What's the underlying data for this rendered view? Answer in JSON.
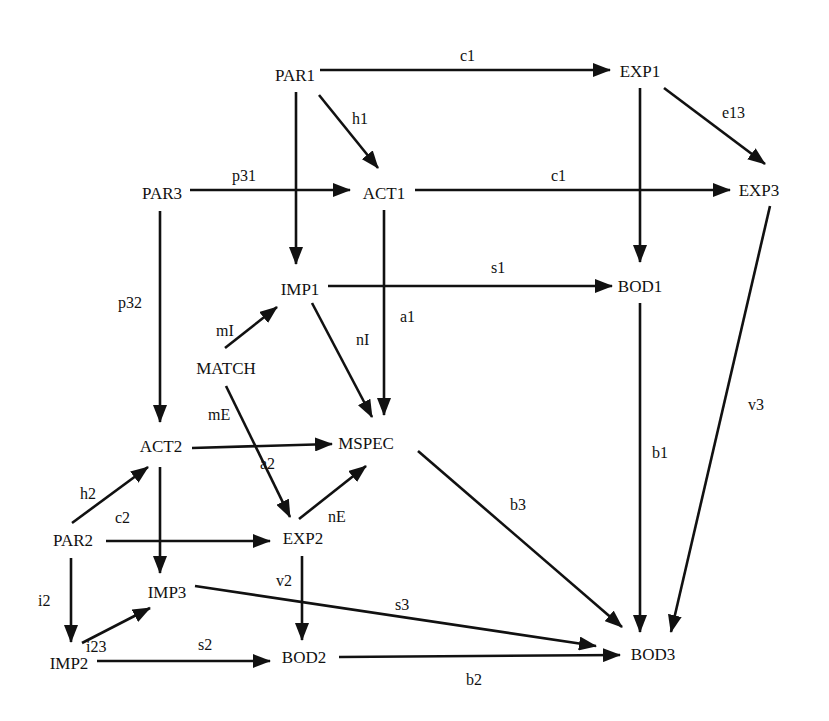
{
  "diagram": {
    "type": "directed-path-diagram",
    "nodes": [
      {
        "id": "PAR1",
        "label": "PAR1",
        "x": 295,
        "y": 75
      },
      {
        "id": "EXP1",
        "label": "EXP1",
        "x": 640,
        "y": 71
      },
      {
        "id": "PAR3",
        "label": "PAR3",
        "x": 162,
        "y": 193
      },
      {
        "id": "ACT1",
        "label": "ACT1",
        "x": 384,
        "y": 193
      },
      {
        "id": "EXP3",
        "label": "EXP3",
        "x": 759,
        "y": 190
      },
      {
        "id": "IMP1",
        "label": "IMP1",
        "x": 300,
        "y": 289
      },
      {
        "id": "BOD1",
        "label": "BOD1",
        "x": 640,
        "y": 286
      },
      {
        "id": "MATCH",
        "label": "MATCH",
        "x": 226,
        "y": 368
      },
      {
        "id": "ACT2",
        "label": "ACT2",
        "x": 161,
        "y": 446
      },
      {
        "id": "MSPEC",
        "label": "MSPEC",
        "x": 366,
        "y": 443
      },
      {
        "id": "PAR2",
        "label": "PAR2",
        "x": 73,
        "y": 540
      },
      {
        "id": "EXP2",
        "label": "EXP2",
        "x": 303,
        "y": 538
      },
      {
        "id": "IMP3",
        "label": "IMP3",
        "x": 167,
        "y": 592
      },
      {
        "id": "IMP2",
        "label": "IMP2",
        "x": 69,
        "y": 663
      },
      {
        "id": "BOD2",
        "label": "BOD2",
        "x": 304,
        "y": 657
      },
      {
        "id": "BOD3",
        "label": "BOD3",
        "x": 653,
        "y": 654
      }
    ],
    "edges": [
      {
        "from": "PAR1",
        "to": "EXP1",
        "label": "c1",
        "x1": 320,
        "y1": 70,
        "x2": 610,
        "y2": 70,
        "lx": 460,
        "ly": 61
      },
      {
        "from": "PAR1",
        "to": "ACT1",
        "label": "h1",
        "x1": 319,
        "y1": 95,
        "x2": 378,
        "y2": 168,
        "lx": 352,
        "ly": 124
      },
      {
        "from": "PAR1",
        "to": "IMP1",
        "label": "",
        "x1": 296,
        "y1": 92,
        "x2": 296,
        "y2": 264,
        "lx": 0,
        "ly": 0
      },
      {
        "from": "EXP1",
        "to": "EXP3",
        "label": "e13",
        "x1": 664,
        "y1": 88,
        "x2": 765,
        "y2": 164,
        "lx": 722,
        "ly": 118
      },
      {
        "from": "EXP1",
        "to": "BOD1",
        "label": "",
        "x1": 640,
        "y1": 88,
        "x2": 640,
        "y2": 262,
        "lx": 0,
        "ly": 0
      },
      {
        "from": "PAR3",
        "to": "ACT1",
        "label": "p31",
        "x1": 190,
        "y1": 190,
        "x2": 350,
        "y2": 190,
        "lx": 232,
        "ly": 181
      },
      {
        "from": "PAR3",
        "to": "ACT2",
        "label": "p32",
        "x1": 160,
        "y1": 211,
        "x2": 160,
        "y2": 422,
        "lx": 118,
        "ly": 308
      },
      {
        "from": "ACT1",
        "to": "EXP3",
        "label": "c1",
        "x1": 415,
        "y1": 190,
        "x2": 730,
        "y2": 190,
        "lx": 551,
        "ly": 181
      },
      {
        "from": "ACT1",
        "to": "MSPEC",
        "label": "a1",
        "x1": 384,
        "y1": 210,
        "x2": 384,
        "y2": 415,
        "lx": 400,
        "ly": 322
      },
      {
        "from": "EXP3",
        "to": "BOD3",
        "label": "v3",
        "x1": 770,
        "y1": 206,
        "x2": 671,
        "y2": 632,
        "lx": 748,
        "ly": 410
      },
      {
        "from": "IMP1",
        "to": "BOD1",
        "label": "s1",
        "x1": 328,
        "y1": 286,
        "x2": 612,
        "y2": 286,
        "lx": 491,
        "ly": 273
      },
      {
        "from": "IMP1",
        "to": "MSPEC",
        "label": "nI",
        "x1": 312,
        "y1": 303,
        "x2": 372,
        "y2": 417,
        "lx": 356,
        "ly": 345
      },
      {
        "from": "BOD1",
        "to": "BOD3",
        "label": "b1",
        "x1": 640,
        "y1": 303,
        "x2": 640,
        "y2": 632,
        "lx": 652,
        "ly": 458
      },
      {
        "from": "MATCH",
        "to": "IMP1",
        "label": "mI",
        "x1": 225,
        "y1": 348,
        "x2": 277,
        "y2": 307,
        "lx": 216,
        "ly": 336
      },
      {
        "from": "MATCH",
        "to": "EXP2",
        "label": "mE",
        "x1": 226,
        "y1": 386,
        "x2": 290,
        "y2": 517,
        "lx": 208,
        "ly": 420
      },
      {
        "from": "ACT2",
        "to": "MSPEC",
        "label": "a2",
        "x1": 192,
        "y1": 448,
        "x2": 332,
        "y2": 444,
        "lx": 260,
        "ly": 469
      },
      {
        "from": "MSPEC",
        "to": "BOD3",
        "label": "b3",
        "x1": 418,
        "y1": 451,
        "x2": 622,
        "y2": 627,
        "lx": 510,
        "ly": 510
      },
      {
        "from": "PAR2",
        "to": "ACT2",
        "label": "h2",
        "x1": 72,
        "y1": 523,
        "x2": 148,
        "y2": 467,
        "lx": 80,
        "ly": 499
      },
      {
        "from": "ACT2",
        "to": "IMP3",
        "label": "c2",
        "x1": 160,
        "y1": 467,
        "x2": 160,
        "y2": 573,
        "lx": 115,
        "ly": 523
      },
      {
        "from": "PAR2",
        "to": "EXP2",
        "label": "",
        "x1": 106,
        "y1": 541,
        "x2": 270,
        "y2": 541,
        "lx": 0,
        "ly": 0
      },
      {
        "from": "EXP2",
        "to": "MSPEC",
        "label": "nE",
        "x1": 299,
        "y1": 519,
        "x2": 366,
        "y2": 466,
        "lx": 328,
        "ly": 522
      },
      {
        "from": "EXP2",
        "to": "BOD2",
        "label": "v2",
        "x1": 302,
        "y1": 556,
        "x2": 302,
        "y2": 640,
        "lx": 276,
        "ly": 586
      },
      {
        "from": "PAR2",
        "to": "IMP2",
        "label": "i2",
        "x1": 71,
        "y1": 558,
        "x2": 71,
        "y2": 642,
        "lx": 38,
        "ly": 606
      },
      {
        "from": "IMP2",
        "to": "IMP3",
        "label": "i23",
        "x1": 82,
        "y1": 643,
        "x2": 150,
        "y2": 608,
        "lx": 86,
        "ly": 652
      },
      {
        "from": "IMP3",
        "to": "BOD3",
        "label": "s3",
        "x1": 195,
        "y1": 586,
        "x2": 596,
        "y2": 646,
        "lx": 395,
        "ly": 610
      },
      {
        "from": "IMP2",
        "to": "BOD2",
        "label": "s2",
        "x1": 97,
        "y1": 661,
        "x2": 270,
        "y2": 661,
        "lx": 198,
        "ly": 650
      },
      {
        "from": "BOD2",
        "to": "BOD3",
        "label": "b2",
        "x1": 339,
        "y1": 657,
        "x2": 620,
        "y2": 655,
        "lx": 466,
        "ly": 685
      }
    ]
  }
}
